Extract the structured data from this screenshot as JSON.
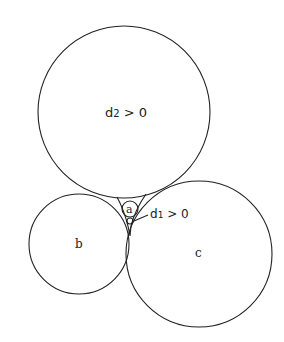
{
  "diagram": {
    "stroke_color": "#222222",
    "background": "#ffffff",
    "circles": [
      {
        "id": "d2",
        "label": "d2 > 0",
        "label_main": "d",
        "label_sub": "2",
        "label_rest": " > 0",
        "cx": 124,
        "cy": 112,
        "r": 86
      },
      {
        "id": "b",
        "label": "b",
        "cx": 79,
        "cy": 244,
        "r": 50
      },
      {
        "id": "c",
        "label": "c",
        "cx": 199,
        "cy": 254,
        "r": 73
      },
      {
        "id": "a",
        "label": "a",
        "cx": 130,
        "cy": 209,
        "r": 8
      },
      {
        "id": "small",
        "label": "",
        "cx": 130,
        "cy": 221,
        "r": 3
      }
    ],
    "annotation": {
      "label": "d1 > 0",
      "label_main": "d",
      "label_sub": "1",
      "label_rest": " > 0"
    }
  }
}
